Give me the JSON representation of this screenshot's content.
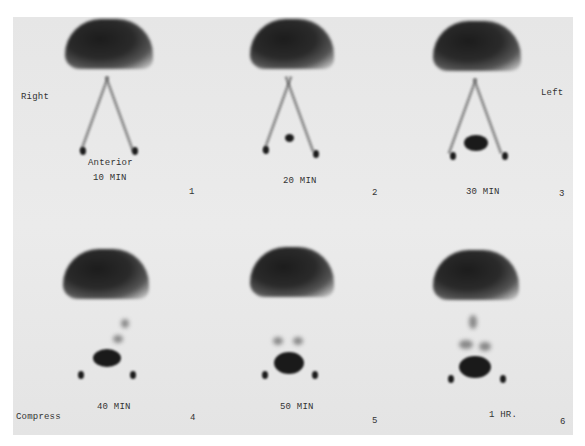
{
  "orientation": {
    "left_side": "Right",
    "right_side": "Left"
  },
  "view": "Anterior",
  "compress_label": "Compress",
  "panels": [
    {
      "index": "1",
      "time": "10 MIN"
    },
    {
      "index": "2",
      "time": "20 MIN"
    },
    {
      "index": "3",
      "time": "30 MIN"
    },
    {
      "index": "4",
      "time": "40 MIN"
    },
    {
      "index": "5",
      "time": "50 MIN"
    },
    {
      "index": "6",
      "time": "1 HR."
    }
  ]
}
